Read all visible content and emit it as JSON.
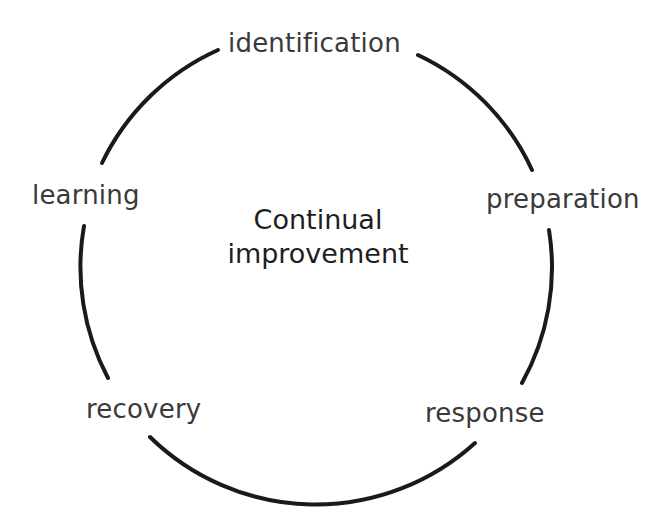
{
  "diagram": {
    "center": {
      "line1": "Continual",
      "line2": "improvement"
    },
    "stages": [
      {
        "label": "identification",
        "position": "top"
      },
      {
        "label": "preparation",
        "position": "right-upper"
      },
      {
        "label": "response",
        "position": "right-lower"
      },
      {
        "label": "recovery",
        "position": "left-lower"
      },
      {
        "label": "learning",
        "position": "left-upper"
      }
    ],
    "colors": {
      "ring": "#1a1a1a",
      "stage_text": "#3a3a3a",
      "center_text": "#1e1e1e",
      "background": "#ffffff"
    }
  }
}
